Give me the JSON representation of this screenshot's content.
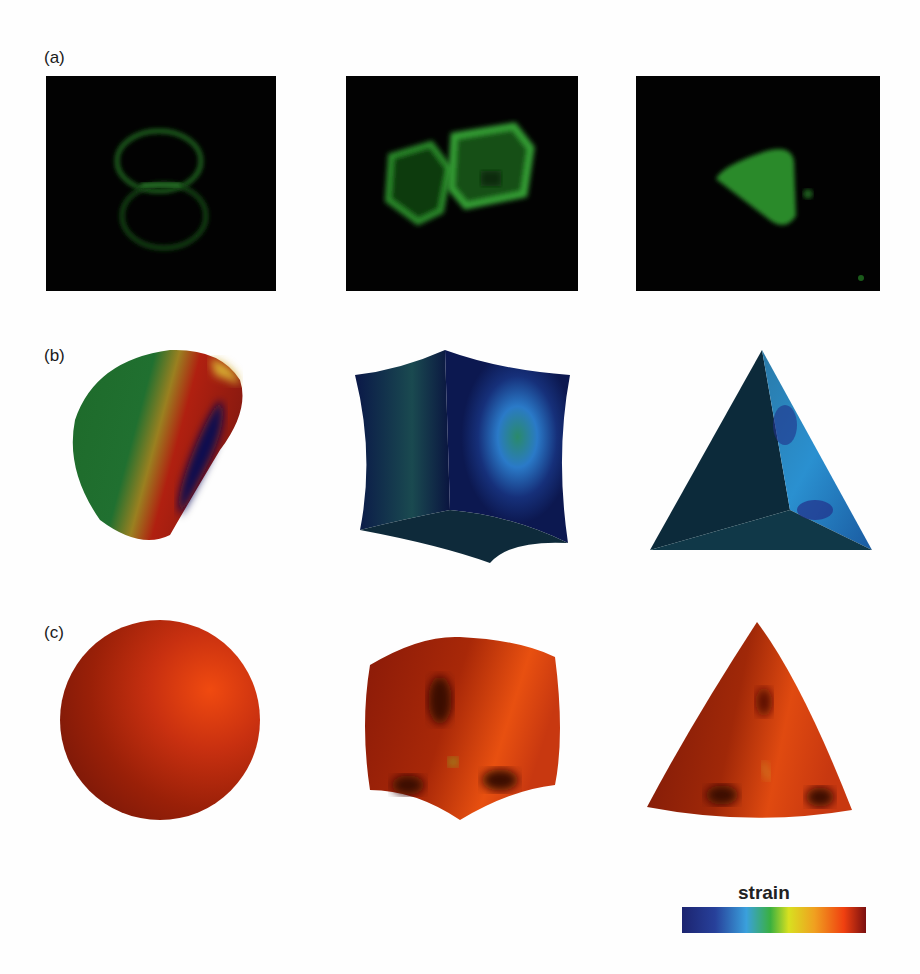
{
  "figure": {
    "panels": [
      {
        "label": "(a)",
        "description": "Fluorescence micrographs (green) of capsules: spherical, cubic, tetrahedral"
      },
      {
        "label": "(b)",
        "description": "Simulated deformed shapes colored by strain (low-strain state)"
      },
      {
        "label": "(c)",
        "description": "Simulated shapes colored by strain (high-strain state)"
      }
    ],
    "columns": [
      "sphere",
      "cube",
      "tetrahedron"
    ],
    "colorbar": {
      "title": "strain",
      "colors": [
        "#1c2470",
        "#27409a",
        "#3aa0dc",
        "#3ab040",
        "#d8e020",
        "#f0a020",
        "#f04010",
        "#7a1010"
      ]
    }
  }
}
